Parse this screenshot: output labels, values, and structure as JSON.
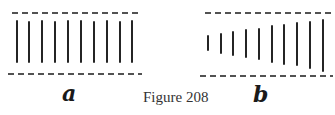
{
  "figure": {
    "caption": "Figure 208",
    "stroke_color": "#1a1a1a",
    "panels": [
      {
        "id": "a",
        "label": "a",
        "description": "equal-length parallel lines between two dashed boundaries",
        "top_dash": {
          "x1": 12,
          "x2": 140,
          "y": 13
        },
        "bottom_dash": {
          "x1": 8,
          "x2": 142,
          "y": 74
        },
        "lines": [
          {
            "x": 17,
            "y1": 21,
            "y2": 62
          },
          {
            "x": 29,
            "y1": 22,
            "y2": 62
          },
          {
            "x": 42,
            "y1": 21,
            "y2": 62
          },
          {
            "x": 55,
            "y1": 22,
            "y2": 62
          },
          {
            "x": 68,
            "y1": 21,
            "y2": 62
          },
          {
            "x": 81,
            "y1": 21,
            "y2": 62
          },
          {
            "x": 94,
            "y1": 22,
            "y2": 62
          },
          {
            "x": 107,
            "y1": 21,
            "y2": 62
          },
          {
            "x": 120,
            "y1": 22,
            "y2": 62
          },
          {
            "x": 132,
            "y1": 21,
            "y2": 62
          }
        ]
      },
      {
        "id": "b",
        "label": "b",
        "description": "parallel lines of increasing length between two dashed boundaries",
        "top_dash": {
          "x1": 205,
          "x2": 332,
          "y": 13
        },
        "bottom_dash": {
          "x1": 200,
          "x2": 333,
          "y": 76
        },
        "lines": [
          {
            "x": 208,
            "y1": 36,
            "y2": 50
          },
          {
            "x": 221,
            "y1": 34,
            "y2": 53
          },
          {
            "x": 233,
            "y1": 32,
            "y2": 55
          },
          {
            "x": 246,
            "y1": 30,
            "y2": 57
          },
          {
            "x": 259,
            "y1": 29,
            "y2": 59
          },
          {
            "x": 272,
            "y1": 26,
            "y2": 62
          },
          {
            "x": 284,
            "y1": 25,
            "y2": 64
          },
          {
            "x": 297,
            "y1": 23,
            "y2": 65
          },
          {
            "x": 310,
            "y1": 22,
            "y2": 68
          },
          {
            "x": 323,
            "y1": 20,
            "y2": 71
          }
        ]
      }
    ]
  }
}
